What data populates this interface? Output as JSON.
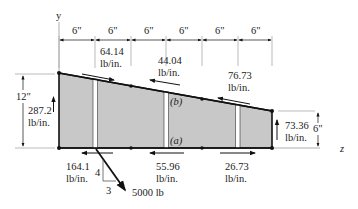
{
  "figure": {
    "axes": {
      "y_label": "y",
      "z_label": "z"
    },
    "dimensions": {
      "top_spacings": [
        "6\"",
        "6\"",
        "6\"",
        "6\"",
        "6\"",
        "6\""
      ],
      "left_height": "12\"",
      "right_height": "6\""
    },
    "shear_flows": {
      "left_web": {
        "value": "287.2",
        "unit": "lb/in."
      },
      "right_web": {
        "value": "73.36",
        "unit": "lb/in."
      },
      "top_1": {
        "value": "64.14",
        "unit": "lb/in."
      },
      "top_2": {
        "value": "44.04",
        "unit": "lb/in."
      },
      "top_3": {
        "value": "76.73",
        "unit": "lb/in."
      },
      "bottom_1": {
        "value": "164.1",
        "unit": "lb/in."
      },
      "bottom_2": {
        "value": "55.96",
        "unit": "lb/in."
      },
      "bottom_3": {
        "value": "26.73",
        "unit": "lb/in."
      }
    },
    "panel_labels": {
      "b": "(b)",
      "a": "(a)"
    },
    "load": {
      "value": "5000 lb",
      "slope_rise": "4",
      "slope_run": "3"
    },
    "colors": {
      "panel_fill": "#c8c8c8",
      "stroke": "#111111"
    }
  }
}
